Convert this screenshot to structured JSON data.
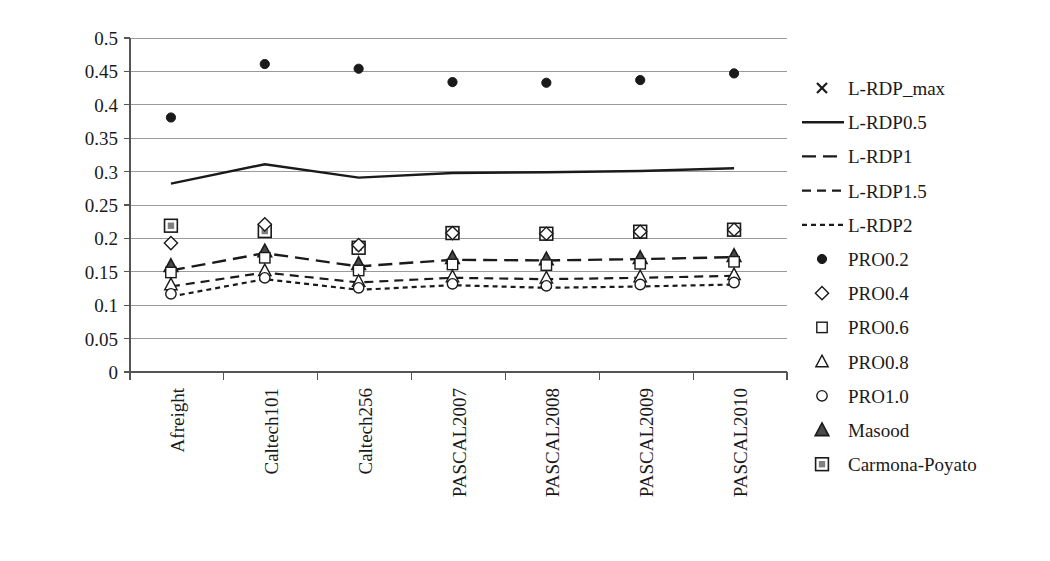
{
  "chart_data": {
    "type": "line",
    "title": "",
    "xlabel": "",
    "ylabel": "",
    "ylim": [
      0,
      0.5
    ],
    "ytick_step": 0.05,
    "grid": true,
    "legend_position": "right",
    "categories": [
      "Afreight",
      "Caltech101",
      "Caltech256",
      "PASCAL2007",
      "PASCAL2008",
      "PASCAL2009",
      "PASCAL2010"
    ],
    "ytick_labels": [
      "0",
      "0.05",
      "0.1",
      "0.15",
      "0.2",
      "0.25",
      "0.3",
      "0.35",
      "0.4",
      "0.45",
      "0.5"
    ],
    "ytick_values": [
      0,
      0.05,
      0.1,
      0.15,
      0.2,
      0.25,
      0.3,
      0.35,
      0.4,
      0.45,
      0.5
    ],
    "series": [
      {
        "name": "L-RDP_max",
        "style": "marker",
        "marker": "cross",
        "values": [
          null,
          null,
          null,
          null,
          null,
          null,
          null
        ]
      },
      {
        "name": "L-RDP0.5",
        "style": "line",
        "dash": "solid",
        "values": [
          0.282,
          0.311,
          0.291,
          0.298,
          0.299,
          0.301,
          0.305
        ]
      },
      {
        "name": "L-RDP1",
        "style": "line",
        "dash": "long-dash",
        "values": [
          0.152,
          0.178,
          0.158,
          0.168,
          0.167,
          0.169,
          0.172
        ]
      },
      {
        "name": "L-RDP1.5",
        "style": "line",
        "dash": "medium-dash",
        "values": [
          0.128,
          0.149,
          0.134,
          0.141,
          0.139,
          0.141,
          0.144
        ]
      },
      {
        "name": "L-RDP2",
        "style": "line",
        "dash": "dotted",
        "values": [
          0.113,
          0.139,
          0.123,
          0.13,
          0.126,
          0.128,
          0.131
        ]
      },
      {
        "name": "PRO0.2",
        "style": "marker",
        "marker": "dot",
        "values": [
          0.381,
          0.461,
          0.454,
          0.434,
          0.433,
          0.437,
          0.447
        ]
      },
      {
        "name": "PRO0.4",
        "style": "marker",
        "marker": "diamond",
        "values": [
          0.193,
          0.221,
          0.19,
          0.208,
          0.207,
          0.21,
          0.213
        ]
      },
      {
        "name": "PRO0.6",
        "style": "marker",
        "marker": "square",
        "values": [
          0.149,
          0.171,
          0.152,
          0.161,
          0.16,
          0.162,
          0.165
        ]
      },
      {
        "name": "PRO0.8",
        "style": "marker",
        "marker": "triangle-open",
        "values": [
          0.131,
          0.152,
          0.136,
          0.143,
          0.141,
          0.143,
          0.146
        ]
      },
      {
        "name": "PRO1.0",
        "style": "marker",
        "marker": "circle",
        "values": [
          0.117,
          0.141,
          0.126,
          0.132,
          0.129,
          0.131,
          0.134
        ]
      },
      {
        "name": "Masood",
        "style": "marker",
        "marker": "triangle-solid",
        "values": [
          0.159,
          0.181,
          0.162,
          0.171,
          0.169,
          0.171,
          0.174
        ]
      },
      {
        "name": "Carmona-Poyato",
        "style": "marker",
        "marker": "square-grey",
        "values": [
          0.219,
          0.211,
          0.186,
          0.208,
          0.207,
          0.21,
          0.213
        ]
      }
    ]
  },
  "legend": {
    "entries": [
      "L-RDP_max",
      "L-RDP0.5",
      "L-RDP1",
      "L-RDP1.5",
      "L-RDP2",
      "PRO0.2",
      "PRO0.4",
      "PRO0.6",
      "PRO0.8",
      "PRO1.0",
      "Masood",
      "Carmona-Poyato"
    ]
  },
  "colors": {
    "ink": "#1a1a1a",
    "grid": "#9a9a9a",
    "axis": "#555555",
    "marker_fill_grey": "#808080",
    "background": "#ffffff"
  }
}
